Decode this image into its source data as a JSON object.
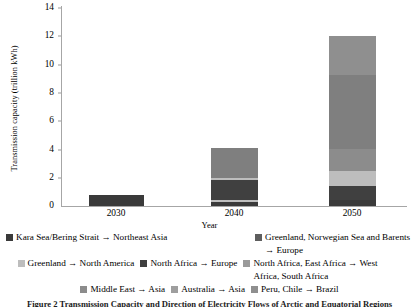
{
  "chart_data": {
    "type": "bar",
    "subtype": "stacked-bar",
    "title": "",
    "xlabel": "Year",
    "ylabel": "Transmission capacity (trillion kWh)",
    "categories": [
      "2030",
      "2040",
      "2050"
    ],
    "ylim": [
      0,
      14
    ],
    "yticks": [
      0,
      2,
      4,
      6,
      8,
      10,
      12,
      14
    ],
    "grid": false,
    "legend_position": "bottom",
    "series": [
      {
        "name": "Kara Sea/Bering Strait → Northeast Asia",
        "color": "#3a3a3a",
        "values": [
          0.8,
          0.25,
          0.45
        ]
      },
      {
        "name": "Greenland, Norwegian Sea and Barents → Europe",
        "color": "#bfbfbf",
        "values": [
          0,
          0.15,
          0.0
        ]
      },
      {
        "name": "Greenland → North America",
        "color": "#a6a6a6",
        "values": [
          0,
          0,
          0.0
        ]
      },
      {
        "name": "North Africa → Europe",
        "color": "#404040",
        "values": [
          0,
          1.45,
          1.0
        ]
      },
      {
        "name": "North Africa, East Africa → West Africa, South Africa",
        "color": "#bdbdbd",
        "values": [
          0,
          0.15,
          1.05
        ]
      },
      {
        "name": "Middle East → Asia",
        "color": "#8c8c8c",
        "values": [
          0,
          0,
          1.55
        ]
      },
      {
        "name": "Australia → Asia",
        "color": "#7f7f7f",
        "values": [
          0,
          2.1,
          5.25
        ]
      },
      {
        "name": "Peru, Chile → Brazil",
        "color": "#8f8f8f",
        "values": [
          0,
          0,
          2.7
        ]
      }
    ],
    "totals": [
      0.8,
      4.1,
      12.0
    ]
  },
  "axes": {
    "ylabel": "Transmission capacity (trillion kWh)",
    "xlabel": "Year",
    "ytick_labels": [
      "14",
      "12",
      "10",
      "8",
      "6",
      "4",
      "2",
      "0"
    ],
    "xtick_labels": [
      "2030",
      "2040",
      "2050"
    ]
  },
  "legend": {
    "row1": [
      {
        "label": "Kara Sea/Bering Strait → Northeast Asia",
        "color": "#3a3a3a"
      },
      {
        "label": "Greenland, Norwegian Sea and Barents → Europe",
        "color": "#5e5e5e"
      }
    ],
    "row2": [
      {
        "label": "Greenland → North America",
        "color": "#bdbdbd"
      },
      {
        "label": "North Africa → Europe",
        "color": "#3f3f3f"
      },
      {
        "label": "North Africa, East Africa → West Africa, South Africa",
        "color": "#9a9a9a"
      }
    ],
    "row3": [
      {
        "label": "Middle East → Asia",
        "color": "#8c8c8c"
      },
      {
        "label": "Australia → Asia",
        "color": "#9e9e9e"
      },
      {
        "label": "Peru, Chile → Brazil",
        "color": "#8f8f8f"
      }
    ]
  },
  "caption": "Figure 2  Transmission Capacity and Direction of Electricity Flows of Arctic and Equatorial Regions"
}
